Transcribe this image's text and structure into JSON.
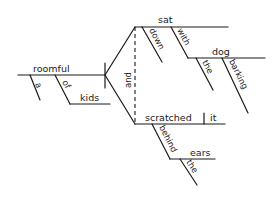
{
  "diagram": {
    "type": "sentence-diagram",
    "subject": {
      "word": "roomful",
      "modifiers": [
        "a",
        "of"
      ],
      "prepositional_object": "kids"
    },
    "conjunction": "and",
    "predicates": [
      {
        "verb": "sat",
        "modifiers": [
          "down",
          "with"
        ],
        "prepositional_object": "dog",
        "object_modifiers": [
          "the",
          "barking"
        ]
      },
      {
        "verb": "scratched",
        "direct_object": "it",
        "modifiers": [
          "behind"
        ],
        "prepositional_object": "ears",
        "object_modifiers": [
          "the"
        ]
      }
    ]
  },
  "labels": {
    "roomful": "roomful",
    "a": "a",
    "of": "of",
    "kids": "kids",
    "and": "and",
    "sat": "sat",
    "down": "down",
    "with": "with",
    "dog": "dog",
    "the1": "the",
    "barking": "barking",
    "scratched": "scratched",
    "it": "it",
    "behind": "behind",
    "ears": "ears",
    "the2": "the"
  }
}
